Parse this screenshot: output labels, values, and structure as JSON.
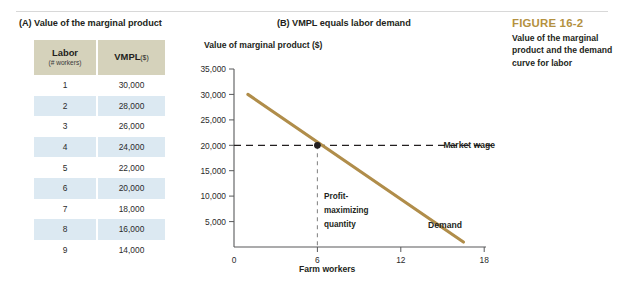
{
  "panels": {
    "a_title": "(A) Value of the marginal product",
    "b_title": "(B) VMPL equals labor demand"
  },
  "table": {
    "headers": {
      "labor_main": "Labor",
      "labor_sub": "(# workers)",
      "vmpl_main": "VMPL",
      "vmpl_unit": "($)"
    },
    "rows": [
      {
        "labor": "1",
        "vmpl": "30,000"
      },
      {
        "labor": "2",
        "vmpl": "28,000"
      },
      {
        "labor": "3",
        "vmpl": "26,000"
      },
      {
        "labor": "4",
        "vmpl": "24,000"
      },
      {
        "labor": "5",
        "vmpl": "22,000"
      },
      {
        "labor": "6",
        "vmpl": "20,000"
      },
      {
        "labor": "7",
        "vmpl": "18,000"
      },
      {
        "labor": "8",
        "vmpl": "16,000"
      },
      {
        "labor": "9",
        "vmpl": "14,000"
      }
    ]
  },
  "caption": {
    "figure_number": "FIGURE 16-2",
    "text": "Value of the marginal product and the demand curve for labor"
  },
  "axes": {
    "y_title": "Value of marginal product ($)",
    "x_title": "Farm workers",
    "y_ticks": [
      "35,000",
      "30,000",
      "25,000",
      "20,000",
      "15,000",
      "10,000",
      "5,000"
    ],
    "x_ticks": [
      "0",
      "6",
      "12",
      "18"
    ]
  },
  "labels": {
    "market_wage": "Market wage",
    "demand": "Demand",
    "profit_max_line1": "Profit-",
    "profit_max_line2": "maximizing",
    "profit_max_line3": "quantity"
  },
  "colors": {
    "demand_curve": "#b08d4a",
    "header_fill": "#d5d2bb",
    "row_alt_fill": "#dce9f2",
    "figure_number": "#b4913f",
    "axis": "#58595b",
    "text": "#231f20"
  },
  "chart_data": {
    "type": "line",
    "title": "(B) VMPL equals labor demand",
    "xlabel": "Farm workers",
    "ylabel": "Value of marginal product ($)",
    "xlim": [
      0,
      19
    ],
    "ylim": [
      0,
      36000
    ],
    "x_ticks": [
      0,
      6,
      12,
      18
    ],
    "y_ticks": [
      5000,
      10000,
      15000,
      20000,
      25000,
      30000,
      35000
    ],
    "grid": false,
    "legend": "inline-labels",
    "series": [
      {
        "name": "Demand",
        "kind": "line",
        "color": "#b08d4a",
        "x": [
          1,
          16.5
        ],
        "y": [
          30000,
          1000
        ]
      },
      {
        "name": "Market wage",
        "kind": "horizontal-dashed",
        "color": "#231f20",
        "y": 20000,
        "x_from": 0,
        "x_to": 18.6
      },
      {
        "name": "Profit-maximizing quantity",
        "kind": "vertical-dashed",
        "color": "#808080",
        "x": 6,
        "y_from": 0,
        "y_to": 20000
      }
    ],
    "points": [
      {
        "label": "equilibrium",
        "x": 6,
        "y": 20000
      }
    ],
    "annotations": [
      {
        "text": "Market wage",
        "x": 18.8,
        "y": 20000
      },
      {
        "text": "Demand",
        "x": 14.6,
        "y": 4200
      },
      {
        "text": "Profit-maximizing quantity",
        "x": 6.6,
        "y": 7800
      }
    ]
  }
}
